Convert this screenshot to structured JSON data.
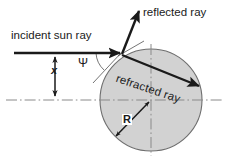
{
  "figure": {
    "background_color": "#ffffff",
    "sphere_fill_color": "#d2d2d2",
    "sphere_stroke_color": "#6e6e6e",
    "ray_color": "#1a1a1a",
    "centerline_color": "#8a8a8a"
  },
  "labels": {
    "incident_ray": "incident sun ray",
    "reflected_ray": "reflected ray",
    "refracted_ray": "refracted ray",
    "angle_psi": "Ψ",
    "offset_x": "x",
    "radius_R": "R"
  },
  "geometry": {
    "sphere_center_x": 151,
    "sphere_center_y": 100,
    "sphere_radius": 51,
    "impact_point_x": 121,
    "impact_point_y": 53,
    "incident_ray_y": 53,
    "incident_ray_start_x": 14,
    "centerline_y": 100,
    "offset_x_value_px": 47
  },
  "elements": {
    "incident_arrow": "arrow-right",
    "reflected_arrow": "arrow-up-right",
    "refracted_arrow": "arrow-down-right",
    "x_dimension_arrow": "double-headed-vertical-arrow",
    "R_dimension_arrow": "double-headed-diagonal-arrow",
    "horizontal_centerline": "dash-dot-line",
    "vertical_centerline": "dash-dot-line",
    "angle_arc": "arc"
  }
}
